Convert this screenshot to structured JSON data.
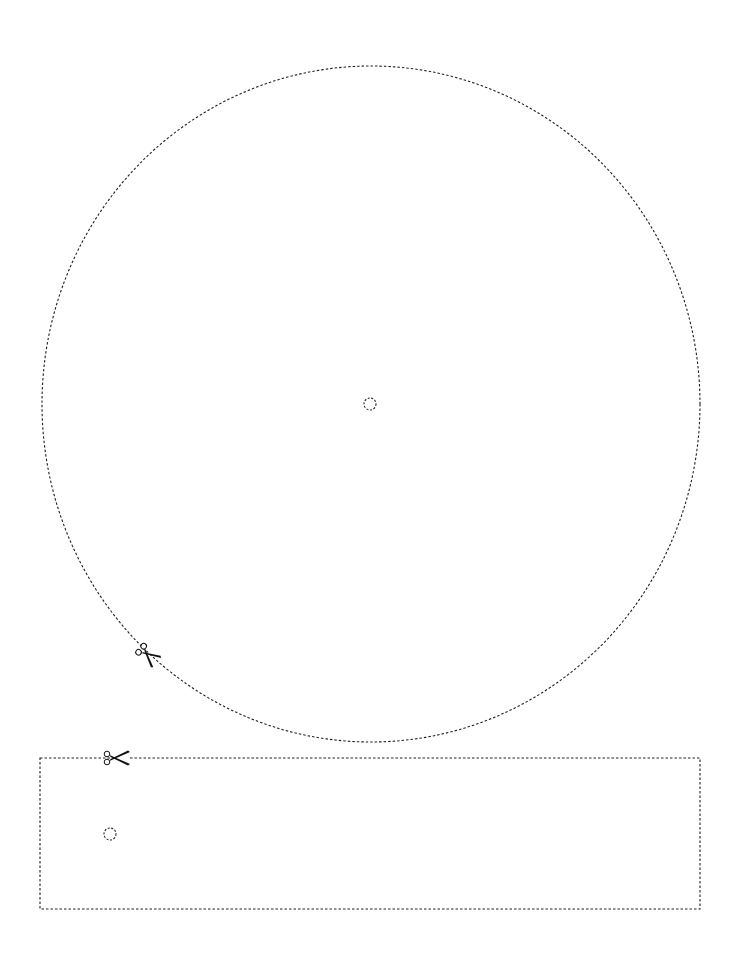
{
  "page": {
    "width": 741,
    "height": 960,
    "background": "#ffffff",
    "line_color": "#222222"
  },
  "template": {
    "disc": {
      "shape": "circle-cut-line",
      "cx": 371,
      "cy": 404,
      "rx": 329,
      "ry": 338,
      "center_hole": {
        "cx": 370,
        "cy": 404,
        "r": 6
      },
      "scissors": {
        "x": 148,
        "y": 655,
        "angle": 40
      }
    },
    "strip": {
      "shape": "rectangle-cut-line",
      "x": 40,
      "y": 758,
      "width": 660,
      "height": 151,
      "hole": {
        "cx": 110,
        "cy": 834,
        "r": 6
      },
      "scissors": {
        "x": 116,
        "y": 758,
        "angle": 0
      }
    }
  },
  "icons": {
    "scissors": "scissors-icon"
  }
}
